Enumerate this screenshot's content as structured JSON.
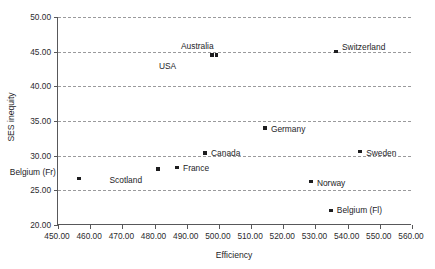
{
  "chart_data": {
    "type": "scatter",
    "title": "",
    "xlabel": "Efficiency",
    "ylabel": "SES inequity",
    "xlim": [
      450,
      560
    ],
    "ylim": [
      20,
      50
    ],
    "xticks": [
      "450.00",
      "460.00",
      "470.00",
      "480.00",
      "490.00",
      "500.00",
      "510.00",
      "520.00",
      "530.00",
      "540.00",
      "550.00",
      "560.00"
    ],
    "xtick_values": [
      450,
      460,
      470,
      480,
      490,
      500,
      510,
      520,
      530,
      540,
      550,
      560
    ],
    "yticks": [
      "20.00",
      "25.00",
      "30.00",
      "35.00",
      "40.00",
      "45.00",
      "50.00"
    ],
    "ytick_values": [
      20,
      25,
      30,
      35,
      40,
      45,
      50
    ],
    "grid": "horizontal-dashed",
    "legend": "none",
    "points": [
      {
        "label": "USA",
        "x": 498.2,
        "y": 44.5,
        "label_dx": -36,
        "label_dy": 7
      },
      {
        "label": "Australia",
        "x": 499.6,
        "y": 44.5,
        "label_dx": -3,
        "label_dy": -13
      },
      {
        "label": "Switzerland",
        "x": 536.7,
        "y": 45.0,
        "label_dx": 6,
        "label_dy": -9
      },
      {
        "label": "Germany",
        "x": 514.6,
        "y": 34.0,
        "label_dx": 6,
        "label_dy": -3
      },
      {
        "label": "Canada",
        "x": 496.0,
        "y": 30.4,
        "label_dx": 6,
        "label_dy": -4
      },
      {
        "label": "Sweden",
        "x": 544.2,
        "y": 30.6,
        "label_dx": 6,
        "label_dy": -3
      },
      {
        "label": "France",
        "x": 487.3,
        "y": 28.3,
        "label_dx": 6,
        "label_dy": -3
      },
      {
        "label": "Scotland",
        "x": 481.4,
        "y": 28.1,
        "label_dx": -16,
        "label_dy": 7
      },
      {
        "label": "Belgium (Fr)",
        "x": 456.8,
        "y": 26.7,
        "label_dx": -23,
        "label_dy": -11
      },
      {
        "label": "Norway",
        "x": 528.9,
        "y": 26.3,
        "label_dx": 6,
        "label_dy": -2
      },
      {
        "label": "Belgium (Fl)",
        "x": 535.1,
        "y": 22.1,
        "label_dx": 6,
        "label_dy": -4
      }
    ]
  },
  "colors": {
    "axis": "#58585a",
    "gridline": "#9a9a9c",
    "marker": "#1d1d1f",
    "text": "#1d1d1f",
    "background": "#ffffff"
  }
}
